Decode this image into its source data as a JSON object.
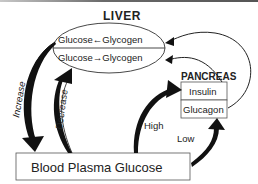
{
  "diagram": {
    "liver": {
      "title": "LIVER",
      "reaction_top": "Glucose←Glycogen",
      "reaction_bottom": "Glucose→Glycogen"
    },
    "pancreas": {
      "title": "PANCREAS",
      "hormone_top": "Insulin",
      "hormone_bottom": "Glucagon"
    },
    "blood": {
      "label": "Blood Plasma Glucose"
    },
    "arrows": {
      "increase": "Increase",
      "decrease": "Decrease",
      "high": "High",
      "low": "Low"
    },
    "colors": {
      "line": "#222222",
      "text": "#222222",
      "background": "#ffffff"
    }
  }
}
